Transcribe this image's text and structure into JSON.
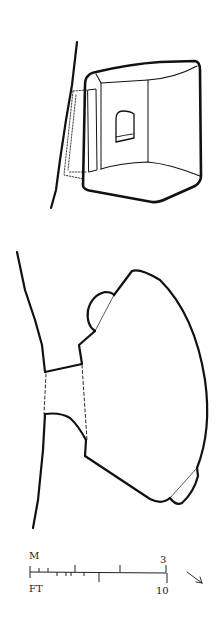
{
  "drawing": {
    "section_view": {
      "label": ""
    },
    "plan_view": {
      "label": ""
    }
  },
  "scale_bar": {
    "metric_label": "M",
    "metric_max": "3",
    "imperial_label": "FT",
    "imperial_max": "10"
  },
  "north_arrow": {
    "icon": "arrow-southeast-icon",
    "glyph": "↘"
  },
  "colors": {
    "ink": "#111111",
    "background": "#ffffff"
  }
}
